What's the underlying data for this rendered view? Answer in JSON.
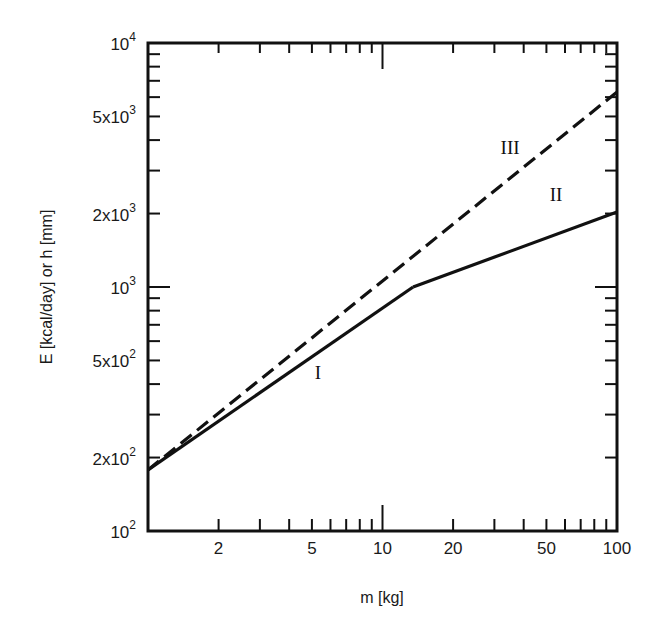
{
  "chart_data": {
    "type": "line",
    "title": "",
    "xlabel": "m [kg]",
    "ylabel": "E [kcal/day]  or  h [mm]",
    "xscale": "log",
    "yscale": "log",
    "xlim": [
      1,
      100
    ],
    "ylim": [
      100,
      10000
    ],
    "x_ticks": [
      {
        "value": 2,
        "label": "2"
      },
      {
        "value": 5,
        "label": "5"
      },
      {
        "value": 10,
        "label": "10"
      },
      {
        "value": 20,
        "label": "20"
      },
      {
        "value": 50,
        "label": "50"
      },
      {
        "value": 100,
        "label": "100"
      }
    ],
    "y_ticks": [
      {
        "value": 100,
        "base": "10",
        "mant": "",
        "exp": "2"
      },
      {
        "value": 200,
        "base": "10",
        "mant": "2x",
        "exp": "2"
      },
      {
        "value": 500,
        "base": "10",
        "mant": "5x",
        "exp": "2"
      },
      {
        "value": 1000,
        "base": "10",
        "mant": "",
        "exp": "3"
      },
      {
        "value": 2000,
        "base": "10",
        "mant": "2x",
        "exp": "3"
      },
      {
        "value": 5000,
        "base": "10",
        "mant": "5x",
        "exp": "3"
      },
      {
        "value": 10000,
        "base": "10",
        "mant": "",
        "exp": "4"
      }
    ],
    "grid": false,
    "legend": "none (inline curve labels)",
    "series": [
      {
        "name": "I",
        "style": "solid",
        "x": [
          1,
          13.5
        ],
        "y": [
          178,
          1000
        ]
      },
      {
        "name": "II",
        "style": "solid",
        "x": [
          13.5,
          100
        ],
        "y": [
          1000,
          2030
        ]
      },
      {
        "name": "III",
        "style": "dashed",
        "x": [
          1,
          100
        ],
        "y": [
          178,
          6300
        ]
      }
    ],
    "annotations": [
      {
        "text": "I",
        "x": 5.3,
        "y": 420
      },
      {
        "text": "II",
        "x": 55,
        "y": 2250
      },
      {
        "text": "III",
        "x": 35,
        "y": 3500
      }
    ]
  }
}
